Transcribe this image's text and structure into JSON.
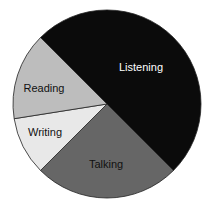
{
  "chart_data": {
    "type": "pie",
    "title": "",
    "categories": [
      "Listening",
      "Talking",
      "Writing",
      "Reading"
    ],
    "values": [
      50,
      25,
      10,
      15
    ],
    "unit": "percent (estimated from slice angles)",
    "colors": [
      "#0b0b0b",
      "#666666",
      "#e8e8e8",
      "#bdbdbd"
    ],
    "label_colors": [
      "#ffffff",
      "#111111",
      "#111111",
      "#111111"
    ],
    "start_angle_deg": -135,
    "direction": "clockwise",
    "legend": "none (labels inside slices)",
    "grid": false
  },
  "geometry": {
    "cx": 107,
    "cy": 104,
    "r": 94
  },
  "labels": {
    "listening": {
      "text": "Listening",
      "x": 141,
      "y": 68
    },
    "talking": {
      "text": "Talking",
      "x": 106,
      "y": 165
    },
    "writing": {
      "text": "Writing",
      "x": 45,
      "y": 133
    },
    "reading": {
      "text": "Reading",
      "x": 44,
      "y": 89
    }
  }
}
